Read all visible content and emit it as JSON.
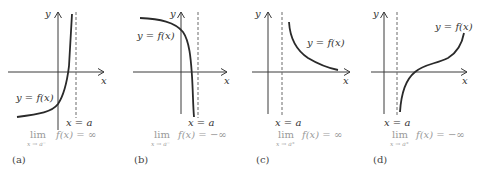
{
  "figure": {
    "panels": [
      {
        "id": "a",
        "caption": "(a)",
        "axis_x_label": "x",
        "axis_y_label": "y",
        "curve_label": "y = f(x)",
        "asymptote_label": "x = a",
        "limit_word": "lim",
        "limit_sub": "x → a⁻",
        "limit_expr": "f(x) = ∞",
        "behavior": "increases to +infinity as x approaches a from the left"
      },
      {
        "id": "b",
        "caption": "(b)",
        "axis_x_label": "x",
        "axis_y_label": "y",
        "curve_label": "y = f(x)",
        "asymptote_label": "x = a",
        "limit_word": "lim",
        "limit_sub": "x → a⁻",
        "limit_expr": "f(x) = −∞",
        "behavior": "decreases to -infinity as x approaches a from the left"
      },
      {
        "id": "c",
        "caption": "(c)",
        "axis_x_label": "x",
        "axis_y_label": "y",
        "curve_label": "y = f(x)",
        "asymptote_label": "x = a",
        "limit_word": "lim",
        "limit_sub": "x → a⁺",
        "limit_expr": "f(x) = ∞",
        "behavior": "increases to +infinity as x approaches a from the right"
      },
      {
        "id": "d",
        "caption": "(d)",
        "axis_x_label": "x",
        "axis_y_label": "y",
        "curve_label": "y = f(x)",
        "asymptote_label": "x = a",
        "limit_word": "lim",
        "limit_sub": "x → a⁺",
        "limit_expr": "f(x) = −∞",
        "behavior": "decreases to -infinity as x approaches a from the right"
      }
    ],
    "colors": {
      "curve": "#2a2a2a",
      "axes": "#3a3a3a",
      "asymptote": "#6b6b6b",
      "limit_text": "#9a9a9a"
    }
  }
}
